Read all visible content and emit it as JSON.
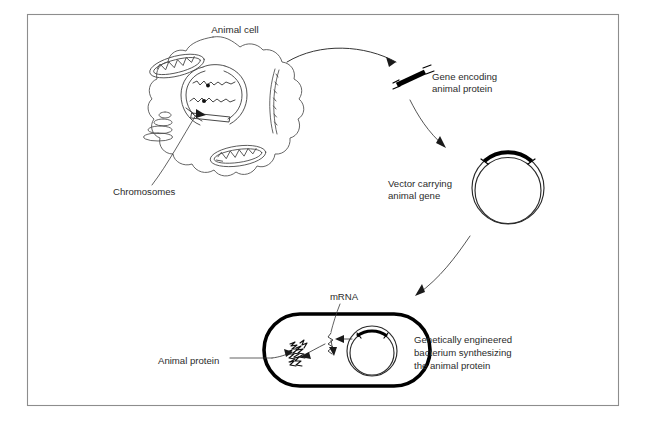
{
  "figure": {
    "background_color": "#ffffff",
    "frame_color": "#8d8d8d",
    "ink_color": "#1a1a1a"
  },
  "labels": {
    "animal_cell": "Animal cell",
    "chromosomes": "Chromosomes",
    "gene_encoding_line1": "Gene encoding",
    "gene_encoding_line2": "animal protein",
    "vector_line1": "Vector carrying",
    "vector_line2": "animal gene",
    "mrna": "mRNA",
    "animal_protein": "Animal protein",
    "bacterium_line1": "Genetically engineered",
    "bacterium_line2": "bacterium synthesizing",
    "bacterium_line3": "the animal protein"
  },
  "stages": [
    {
      "id": "animal-cell",
      "name": "Animal cell",
      "description": "Wavy-outlined eukaryotic cell containing a nucleus with chromosomes, two mitochondria, a Golgi apparatus and endoplasmic reticulum strands",
      "organelles": [
        "nucleus",
        "chromosomes",
        "mitochondrion-upper",
        "mitochondrion-lower",
        "golgi-apparatus",
        "endoplasmic-reticulum"
      ]
    },
    {
      "id": "gene-fragment",
      "name": "Gene encoding animal protein",
      "description": "Thick black DNA fragment with sticky ends excised from the animal chromosome"
    },
    {
      "id": "vector-plasmid",
      "name": "Vector carrying animal gene",
      "description": "Circular double-stranded plasmid with the animal gene inserted as a thick black arc at the top"
    },
    {
      "id": "engineered-bacterium",
      "name": "Genetically engineered bacterium synthesizing the animal protein",
      "description": "Stadium-shaped bacterium with thick cell wall containing the recombinant plasmid, mRNA transcript and a mass of animal protein"
    }
  ],
  "flow_arrows": [
    {
      "from": "animal-cell",
      "to": "gene-fragment",
      "style": "curved"
    },
    {
      "from": "gene-fragment",
      "to": "vector-plasmid",
      "style": "curved"
    },
    {
      "from": "vector-plasmid",
      "to": "engineered-bacterium",
      "style": "curved"
    },
    {
      "from": "vector-plasmid-in-bacterium",
      "to": "mrna",
      "style": "short"
    },
    {
      "from": "mrna",
      "to": "animal-protein",
      "style": "short"
    }
  ],
  "colors": {
    "gene_black": "#000000",
    "outline_gray": "#555555",
    "frame_gray": "#8d8d8d",
    "text_gray": "#2b2b2b"
  }
}
